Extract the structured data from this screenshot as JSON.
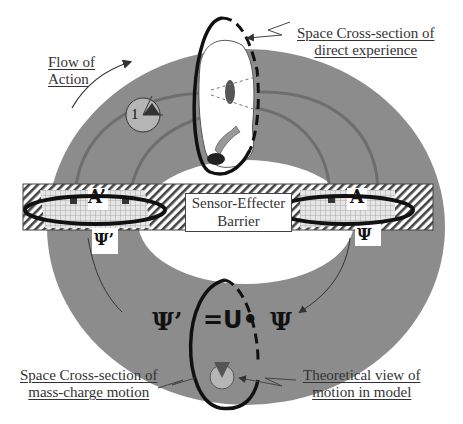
{
  "diagram": {
    "labels": {
      "flow_of_action": [
        "Flow of",
        "Action"
      ],
      "direct_experience": [
        "Space Cross-section of",
        "direct experience"
      ],
      "barrier": [
        "Sensor-Effecter",
        "Barrier"
      ],
      "mass_charge": [
        "Space Cross-section of",
        "mass-charge motion"
      ],
      "theoretical": [
        "Theoretical view of",
        "motion in model"
      ]
    },
    "symbols": {
      "a_prime": "A’",
      "a": "A",
      "psi_prime_small": "Ψ’",
      "psi_small": "Ψ",
      "psi_prime_big": "Ψ’",
      "equation": "=U•",
      "psi_big": "Ψ",
      "observer_number": "1"
    },
    "colors": {
      "ring": "#8c8c8c",
      "ring_dark": "#777777",
      "hatch": "#555555",
      "ellipse": "#111111",
      "inner_disc": "#b5b5b5"
    }
  }
}
